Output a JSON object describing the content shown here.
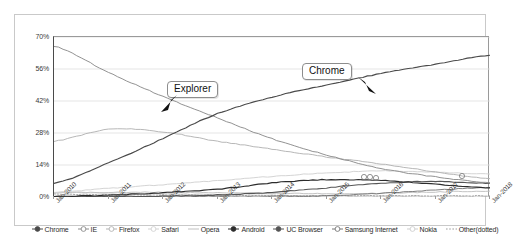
{
  "chart_data": {
    "type": "line",
    "title": "",
    "subtitle": "",
    "xlabel": "",
    "ylabel": "",
    "grid": true,
    "legend_position": "bottom",
    "ylim": [
      0,
      70
    ],
    "yticks": [
      "0%",
      "14%",
      "28%",
      "42%",
      "56%",
      "70%"
    ],
    "ytick_values": [
      0,
      14,
      28,
      42,
      56,
      70
    ],
    "xticks": [
      "Jan-2010",
      "Jan-2011",
      "Jan-2012",
      "Jan-2013",
      "Jan-2014",
      "Jan-2015",
      "Jan-2016",
      "Jan-2017",
      "Jan-2018"
    ],
    "x": [
      "Jan-2010",
      "Jan-2011",
      "Jan-2012",
      "Jan-2013",
      "Jan-2014",
      "Jan-2015",
      "Jan-2016",
      "Jan-2017",
      "Jan-2018"
    ],
    "annotations": [
      {
        "text": "Explorer",
        "points_to": "IE",
        "x": "Jan-2012",
        "y": 42
      },
      {
        "text": "Chrome",
        "points_to": "Chrome",
        "x": "Jan-2015",
        "y": 50
      }
    ],
    "series": [
      {
        "name": "Chrome",
        "color": "#4a4a4a",
        "marker": "circle-dot",
        "values": [
          6.0,
          14.9,
          25.6,
          36.5,
          43.7,
          49.0,
          54.0,
          58.1,
          62.0
        ]
      },
      {
        "name": "IE",
        "color": "#8c8c8c",
        "marker": "circle-dot",
        "values": [
          66.0,
          54.5,
          44.0,
          34.6,
          25.5,
          18.4,
          12.5,
          8.8,
          6.2
        ]
      },
      {
        "name": "Firefox",
        "color": "#b3b3b3",
        "marker": "circle-open",
        "values": [
          24.4,
          29.6,
          28.5,
          24.4,
          21.0,
          17.5,
          14.5,
          11.0,
          8.0
        ]
      },
      {
        "name": "Safari",
        "color": "#d2d2d2",
        "marker": "circle-open",
        "values": [
          2.0,
          3.8,
          5.4,
          7.2,
          9.0,
          10.5,
          11.4,
          10.8,
          10.0
        ]
      },
      {
        "name": "Opera",
        "color": "#c0c0c0",
        "marker": "line",
        "values": [
          1.9,
          2.0,
          2.1,
          1.8,
          1.6,
          1.5,
          1.6,
          2.2,
          2.6
        ]
      },
      {
        "name": "Android",
        "color": "#2c2c2c",
        "marker": "circle-dot",
        "values": [
          0.3,
          0.8,
          1.9,
          3.4,
          6.2,
          7.6,
          7.2,
          5.6,
          4.0
        ]
      },
      {
        "name": "UC Browser",
        "color": "#555555",
        "marker": "circle-dot",
        "values": [
          0.1,
          0.2,
          0.4,
          0.9,
          2.0,
          4.0,
          6.0,
          6.8,
          6.0
        ]
      },
      {
        "name": "Samsung Internet",
        "color": "#777777",
        "marker": "circle-open",
        "values": [
          0.0,
          0.0,
          0.0,
          0.1,
          0.2,
          0.5,
          1.6,
          3.0,
          4.2
        ]
      },
      {
        "name": "Nokia",
        "color": "#cfcfcf",
        "marker": "circle-open",
        "values": [
          2.1,
          1.8,
          1.4,
          1.0,
          0.7,
          0.4,
          0.2,
          0.1,
          0.1
        ]
      },
      {
        "name": "Other(dotted)",
        "color": "#9e9e9e",
        "marker": "line-dotted",
        "values": [
          1.2,
          1.0,
          0.9,
          0.8,
          0.7,
          0.6,
          0.5,
          0.5,
          0.5
        ]
      }
    ]
  },
  "axis": {
    "y_labels": [
      "70%",
      "56%",
      "42%",
      "28%",
      "14%",
      "0%"
    ],
    "x_labels": [
      "Jan-2010",
      "Jan-2011",
      "Jan-2012",
      "Jan-2013",
      "Jan-2014",
      "Jan-2015",
      "Jan-2016",
      "Jan-2017",
      "Jan-2018"
    ]
  },
  "callouts": {
    "explorer": "Explorer",
    "chrome": "Chrome"
  },
  "legend": {
    "items": [
      {
        "label": "Chrome",
        "marker": "circle-dot",
        "color": "#4a4a4a"
      },
      {
        "label": "IE",
        "marker": "circle-open",
        "color": "#8c8c8c"
      },
      {
        "label": "Firefox",
        "marker": "circle-open",
        "color": "#b3b3b3"
      },
      {
        "label": "Safari",
        "marker": "circle-open",
        "color": "#d2d2d2"
      },
      {
        "label": "Opera",
        "marker": "line",
        "color": "#c0c0c0"
      },
      {
        "label": "Android",
        "marker": "circle-dot",
        "color": "#2c2c2c"
      },
      {
        "label": "UC Browser",
        "marker": "circle-dot",
        "color": "#555555"
      },
      {
        "label": "Samsung Internet",
        "marker": "circle-open",
        "color": "#777777"
      },
      {
        "label": "Nokia",
        "marker": "circle-open",
        "color": "#cfcfcf"
      },
      {
        "label": "Other(dotted)",
        "marker": "line-dotted",
        "color": "#9e9e9e"
      }
    ]
  }
}
